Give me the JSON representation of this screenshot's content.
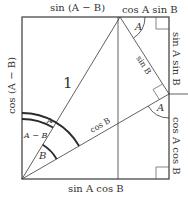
{
  "figure": {
    "type": "geometric-proof-diagram",
    "colors": {
      "line": "#3a3a3a",
      "text": "#333333",
      "background": "#ffffff"
    }
  },
  "labels": {
    "top_left_segment": "sin (A − B)",
    "top_right_segment": "cos A sin B",
    "right_upper_segment": "sin A sin B",
    "right_lower_segment": "cos A cos B",
    "bottom_segment": "sin A cos B",
    "left_side": "cos (A − B)",
    "hypotenuse": "1",
    "side_sin_b": "sin B",
    "side_cos_b": "cos B",
    "angle_top": "A",
    "angle_right": "A",
    "angle_origin_a": "A",
    "angle_origin_a_minus_b": "A − B",
    "angle_origin_b": "B"
  },
  "geometry": {
    "rect": {
      "left": 22,
      "top": 17,
      "right": 169,
      "bottom": 179
    },
    "origin": [
      22,
      179
    ],
    "top_vertex": [
      120,
      17
    ],
    "right_vertex": [
      169,
      94
    ],
    "inner_vertical_x": 118
  }
}
